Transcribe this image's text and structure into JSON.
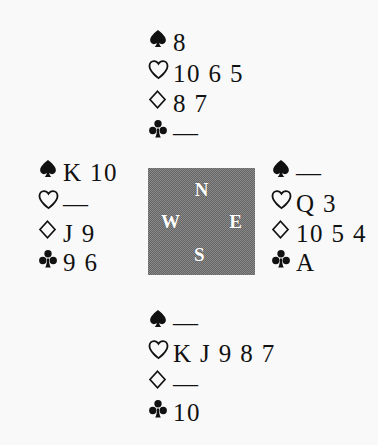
{
  "diagram": {
    "type": "bridge-hand-diagram",
    "void_marker": "—",
    "colors": {
      "page_background": "#f9f9f9",
      "ink": "#111111",
      "compass_box": "#8a8a8a",
      "compass_letter": "#ffffff"
    },
    "suits": [
      {
        "key": "spade",
        "symbol": "♠",
        "name": "spade-symbol",
        "filled": true
      },
      {
        "key": "heart",
        "symbol": "♡",
        "name": "heart-symbol",
        "filled": false
      },
      {
        "key": "diamond",
        "symbol": "♢",
        "name": "diamond-symbol",
        "filled": false
      },
      {
        "key": "club",
        "symbol": "♣",
        "name": "club-symbol",
        "filled": true
      }
    ],
    "compass": {
      "north": "N",
      "west": "W",
      "east": "E",
      "south": "S"
    },
    "hands": {
      "north": {
        "position_label": "North",
        "spades": "8",
        "hearts": "10 6 5",
        "diamonds": "8 7",
        "clubs": "—"
      },
      "west": {
        "position_label": "West",
        "spades": "K 10",
        "hearts": "—",
        "diamonds": "J 9",
        "clubs": "9 6"
      },
      "east": {
        "position_label": "East",
        "spades": "—",
        "hearts": "Q 3",
        "diamonds": "10 5 4",
        "clubs": "A"
      },
      "south": {
        "position_label": "South",
        "spades": "—",
        "hearts": "K J 9 8 7",
        "diamonds": "—",
        "clubs": "10"
      }
    }
  }
}
